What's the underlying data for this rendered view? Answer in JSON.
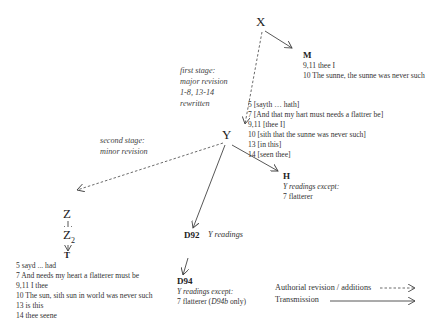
{
  "nodes": {
    "X": {
      "label": "X"
    },
    "M": {
      "label": "M",
      "lines": [
        "9,11 thee I",
        "10 The sunne, the sunne was never such"
      ]
    },
    "Y": {
      "label": "Y",
      "lines": [
        "5 [sayth … hath]",
        "7 [And that my hart must needs a flattrer be]",
        "9,11 [thee I]",
        "10 [sith that the sunne was never such]",
        "13 [in this]",
        "14 [seen thee]"
      ]
    },
    "H": {
      "label": "H",
      "caption": "Y readings except:",
      "lines": [
        "7 flatterer"
      ]
    },
    "Z": {
      "label": "Z"
    },
    "Z2": {
      "label": "Z",
      "sub": "2"
    },
    "T": {
      "label": "T",
      "lines": [
        "5 sayd ... had",
        "7 And needs my heart a flatterer must be",
        "9,11 I thee",
        "10 The sun, sith sun in world was never such",
        "13 is this",
        "14 thee seene"
      ]
    },
    "D92": {
      "label": "D92",
      "caption": "Y readings"
    },
    "D94": {
      "label": "D94",
      "caption": "Y readings except:",
      "line_prefix": "7 flatterer (",
      "line_italic": "D94b",
      "line_suffix": " only)"
    }
  },
  "annotations": {
    "first_stage": [
      "first stage:",
      "major revision",
      "1-8, 13-14",
      "rewritten"
    ],
    "second_stage": [
      "second stage:",
      "minor revision"
    ]
  },
  "legend": {
    "authorial": "Authorial revision / additions",
    "transmission": "Transmission"
  },
  "colors": {
    "line": "#444444",
    "text": "#333333"
  }
}
